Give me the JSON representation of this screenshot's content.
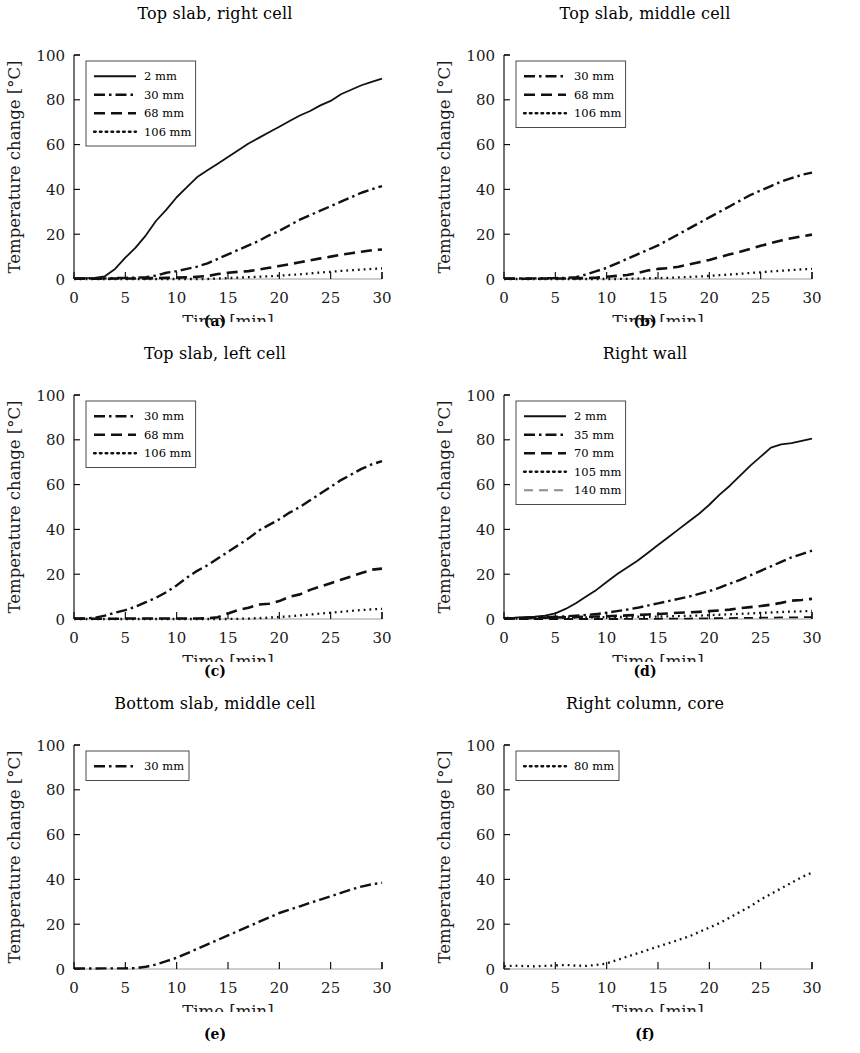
{
  "figure": {
    "ylabel": "Temperature change [°C]",
    "xlabel": "Time [min]",
    "y_ticks": [
      "0",
      "20",
      "40",
      "60",
      "80",
      "100"
    ],
    "x_ticks": [
      "0",
      "5",
      "10",
      "15",
      "20",
      "25",
      "30"
    ],
    "captions": [
      "(a)",
      "(b)",
      "(c)",
      "(d)",
      "(e)",
      "(f)"
    ]
  },
  "chart_data": [
    {
      "type": "line",
      "panel": "a",
      "caption": "(a)",
      "title": "Top slab, right cell",
      "xlabel": "Time [min]",
      "ylabel": "Temperature change [°C]",
      "xlim": [
        0,
        30
      ],
      "ylim": [
        0,
        100
      ],
      "xticks": [
        0,
        5,
        10,
        15,
        20,
        25,
        30
      ],
      "yticks": [
        0,
        20,
        40,
        60,
        80,
        100
      ],
      "grid": false,
      "legend_position": "upper-left",
      "x": [
        0,
        1,
        2,
        3,
        4,
        5,
        6,
        7,
        8,
        9,
        10,
        11,
        12,
        13,
        14,
        15,
        16,
        17,
        18,
        19,
        20,
        21,
        22,
        23,
        24,
        25,
        26,
        27,
        28,
        29,
        30
      ],
      "series": [
        {
          "name": "2 mm",
          "style": "solid",
          "values": [
            0.3,
            0.4,
            0.5,
            1.2,
            4.5,
            9.5,
            14.0,
            19.5,
            26.0,
            31.0,
            36.5,
            41.0,
            45.5,
            48.5,
            51.5,
            54.5,
            57.5,
            60.5,
            63.0,
            65.5,
            68.0,
            70.5,
            73.0,
            75.0,
            77.5,
            79.5,
            82.5,
            84.5,
            86.5,
            88.0,
            89.5
          ]
        },
        {
          "name": "30 mm",
          "style": "dashdot",
          "values": [
            0.2,
            0.2,
            0.3,
            0.3,
            0.4,
            0.5,
            0.6,
            0.8,
            1.5,
            2.8,
            3.5,
            4.5,
            5.5,
            7.0,
            9.0,
            11.0,
            13.0,
            15.0,
            17.0,
            19.5,
            21.5,
            24.0,
            26.5,
            28.5,
            30.5,
            32.5,
            34.5,
            36.5,
            38.5,
            40.0,
            41.5
          ]
        },
        {
          "name": "68 mm",
          "style": "dashed",
          "values": [
            0.1,
            0.1,
            0.1,
            0.1,
            0.2,
            0.2,
            0.2,
            0.3,
            0.4,
            0.5,
            0.6,
            0.8,
            1.0,
            1.3,
            2.2,
            2.8,
            3.2,
            3.5,
            4.2,
            5.0,
            5.8,
            6.6,
            7.5,
            8.3,
            9.2,
            10.0,
            10.8,
            11.5,
            12.2,
            12.8,
            13.2
          ]
        },
        {
          "name": "106 mm",
          "style": "dotted",
          "values": [
            0.0,
            0.0,
            0.0,
            0.0,
            0.0,
            0.0,
            0.0,
            0.0,
            0.0,
            0.0,
            0.0,
            0.0,
            0.0,
            0.0,
            0.2,
            0.4,
            0.6,
            0.8,
            1.0,
            1.2,
            1.5,
            1.8,
            2.1,
            2.5,
            2.9,
            3.2,
            3.6,
            3.9,
            4.2,
            4.5,
            4.7
          ]
        }
      ]
    },
    {
      "type": "line",
      "panel": "b",
      "caption": "(b)",
      "title": "Top slab, middle cell",
      "xlabel": "Time [min]",
      "ylabel": "Temperature change [°C]",
      "xlim": [
        0,
        30
      ],
      "ylim": [
        0,
        100
      ],
      "xticks": [
        0,
        5,
        10,
        15,
        20,
        25,
        30
      ],
      "yticks": [
        0,
        20,
        40,
        60,
        80,
        100
      ],
      "grid": false,
      "legend_position": "upper-left",
      "x": [
        0,
        1,
        2,
        3,
        4,
        5,
        6,
        7,
        8,
        9,
        10,
        11,
        12,
        13,
        14,
        15,
        16,
        17,
        18,
        19,
        20,
        21,
        22,
        23,
        24,
        25,
        26,
        27,
        28,
        29,
        30
      ],
      "series": [
        {
          "name": "30 mm",
          "style": "dashdot",
          "values": [
            0.2,
            0.2,
            0.3,
            0.3,
            0.4,
            0.4,
            0.5,
            0.8,
            2.0,
            3.5,
            5.0,
            7.0,
            9.0,
            11.0,
            13.0,
            15.0,
            17.5,
            20.0,
            22.5,
            25.0,
            27.5,
            30.0,
            32.5,
            35.0,
            37.5,
            39.5,
            41.5,
            43.5,
            45.0,
            46.5,
            47.5
          ]
        },
        {
          "name": "68 mm",
          "style": "dashed",
          "values": [
            0.1,
            0.1,
            0.1,
            0.1,
            0.2,
            0.2,
            0.2,
            0.3,
            0.4,
            0.6,
            1.0,
            1.4,
            1.8,
            2.6,
            3.8,
            4.5,
            4.8,
            5.5,
            6.5,
            7.5,
            8.5,
            9.8,
            11.0,
            12.2,
            13.5,
            14.8,
            16.0,
            17.2,
            18.2,
            19.0,
            19.8
          ]
        },
        {
          "name": "106 mm",
          "style": "dotted",
          "values": [
            0.0,
            0.0,
            0.0,
            0.0,
            0.0,
            0.0,
            0.0,
            0.0,
            0.0,
            0.0,
            0.0,
            0.0,
            0.1,
            0.2,
            0.3,
            0.4,
            0.5,
            0.7,
            0.9,
            1.1,
            1.4,
            1.7,
            2.0,
            2.3,
            2.7,
            3.0,
            3.4,
            3.7,
            4.0,
            4.3,
            4.5
          ]
        }
      ]
    },
    {
      "type": "line",
      "panel": "c",
      "caption": "(c)",
      "title": "Top slab, left cell",
      "xlabel": "Time [min]",
      "ylabel": "Temperature change [°C]",
      "xlim": [
        0,
        30
      ],
      "ylim": [
        0,
        100
      ],
      "xticks": [
        0,
        5,
        10,
        15,
        20,
        25,
        30
      ],
      "yticks": [
        0,
        20,
        40,
        60,
        80,
        100
      ],
      "grid": false,
      "legend_position": "upper-left",
      "x": [
        0,
        1,
        2,
        3,
        4,
        5,
        6,
        7,
        8,
        9,
        10,
        11,
        12,
        13,
        14,
        15,
        16,
        17,
        18,
        19,
        20,
        21,
        22,
        23,
        24,
        25,
        26,
        27,
        28,
        29,
        30
      ],
      "series": [
        {
          "name": "30 mm",
          "style": "dashdot",
          "values": [
            0.2,
            0.3,
            0.5,
            1.5,
            2.8,
            4.0,
            5.5,
            7.5,
            9.5,
            12.0,
            15.0,
            18.5,
            21.5,
            24.0,
            27.0,
            30.0,
            33.0,
            36.0,
            39.5,
            42.0,
            44.5,
            47.5,
            50.0,
            53.0,
            56.0,
            59.0,
            62.0,
            64.5,
            67.0,
            69.0,
            70.5
          ]
        },
        {
          "name": "68 mm",
          "style": "dashed",
          "values": [
            0.1,
            0.1,
            0.1,
            0.1,
            0.1,
            0.2,
            0.2,
            0.2,
            0.2,
            0.2,
            0.2,
            0.2,
            0.2,
            0.3,
            0.8,
            2.5,
            4.0,
            5.0,
            6.5,
            6.8,
            8.0,
            10.0,
            11.0,
            13.0,
            14.5,
            16.0,
            17.5,
            19.0,
            20.5,
            22.0,
            22.5
          ]
        },
        {
          "name": "106 mm",
          "style": "dotted",
          "values": [
            0.0,
            0.0,
            0.0,
            0.0,
            0.0,
            0.0,
            0.0,
            0.0,
            0.0,
            0.0,
            0.0,
            0.0,
            0.0,
            0.0,
            0.0,
            0.0,
            0.1,
            0.2,
            0.4,
            0.6,
            0.9,
            1.2,
            1.6,
            2.0,
            2.4,
            2.8,
            3.2,
            3.6,
            4.0,
            4.3,
            4.5
          ]
        }
      ]
    },
    {
      "type": "line",
      "panel": "d",
      "caption": "(d)",
      "title": "Right wall",
      "xlabel": "Time [min]",
      "ylabel": "Temperature change [°C]",
      "xlim": [
        0,
        30
      ],
      "ylim": [
        0,
        100
      ],
      "xticks": [
        0,
        5,
        10,
        15,
        20,
        25,
        30
      ],
      "yticks": [
        0,
        20,
        40,
        60,
        80,
        100
      ],
      "grid": false,
      "legend_position": "upper-left",
      "x": [
        0,
        1,
        2,
        3,
        4,
        5,
        6,
        7,
        8,
        9,
        10,
        11,
        12,
        13,
        14,
        15,
        16,
        17,
        18,
        19,
        20,
        21,
        22,
        23,
        24,
        25,
        26,
        27,
        28,
        29,
        30
      ],
      "series": [
        {
          "name": "2 mm",
          "style": "solid",
          "values": [
            0.5,
            0.6,
            0.8,
            1.0,
            1.5,
            2.5,
            4.5,
            7.0,
            10.0,
            13.0,
            16.5,
            20.0,
            23.0,
            26.0,
            29.5,
            33.0,
            36.5,
            40.0,
            43.5,
            47.0,
            51.0,
            55.5,
            59.5,
            64.0,
            68.5,
            72.5,
            76.5,
            78.0,
            78.5,
            79.5,
            80.5
          ]
        },
        {
          "name": "35 mm",
          "style": "dashdot",
          "values": [
            0.3,
            0.4,
            0.5,
            0.6,
            0.8,
            1.0,
            1.2,
            1.5,
            1.8,
            2.2,
            2.8,
            3.5,
            4.2,
            5.0,
            6.0,
            7.0,
            8.0,
            9.0,
            10.0,
            11.2,
            12.5,
            14.0,
            15.8,
            17.5,
            19.5,
            21.5,
            23.5,
            25.5,
            27.5,
            29.0,
            30.5
          ]
        },
        {
          "name": "70 mm",
          "style": "dashed",
          "values": [
            0.2,
            0.3,
            0.4,
            0.5,
            0.6,
            0.7,
            0.8,
            0.9,
            1.0,
            1.1,
            1.2,
            1.4,
            1.6,
            1.8,
            2.0,
            2.2,
            2.5,
            2.8,
            3.0,
            3.2,
            3.5,
            3.8,
            4.2,
            4.8,
            5.3,
            5.8,
            6.4,
            7.2,
            8.2,
            8.5,
            9.0
          ]
        },
        {
          "name": "105 mm",
          "style": "dotted",
          "values": [
            0.1,
            0.2,
            0.3,
            0.4,
            0.5,
            0.6,
            0.6,
            0.7,
            0.7,
            0.8,
            0.8,
            0.9,
            0.9,
            1.0,
            1.0,
            1.1,
            1.2,
            1.3,
            1.4,
            1.5,
            1.7,
            1.9,
            2.1,
            2.3,
            2.5,
            2.7,
            2.9,
            3.1,
            3.3,
            3.4,
            3.6
          ]
        },
        {
          "name": "140 mm",
          "style": "dashed-light",
          "values": [
            0.0,
            0.0,
            0.0,
            0.0,
            0.0,
            0.0,
            0.0,
            0.0,
            0.0,
            0.0,
            0.0,
            0.0,
            0.1,
            0.1,
            0.1,
            0.1,
            0.2,
            0.2,
            0.2,
            0.3,
            0.3,
            0.4,
            0.4,
            0.5,
            0.5,
            0.6,
            0.6,
            0.7,
            0.7,
            0.8,
            0.8
          ]
        }
      ]
    },
    {
      "type": "line",
      "panel": "e",
      "caption": "(e)",
      "title": "Bottom slab, middle cell",
      "xlabel": "Time [min]",
      "ylabel": "Temperature change [°C]",
      "xlim": [
        0,
        30
      ],
      "ylim": [
        0,
        100
      ],
      "xticks": [
        0,
        5,
        10,
        15,
        20,
        25,
        30
      ],
      "yticks": [
        0,
        20,
        40,
        60,
        80,
        100
      ],
      "grid": false,
      "legend_position": "upper-left",
      "x": [
        0,
        1,
        2,
        3,
        4,
        5,
        6,
        7,
        8,
        9,
        10,
        11,
        12,
        13,
        14,
        15,
        16,
        17,
        18,
        19,
        20,
        21,
        22,
        23,
        24,
        25,
        26,
        27,
        28,
        29,
        30
      ],
      "series": [
        {
          "name": "30 mm",
          "style": "dashdot",
          "values": [
            0.2,
            0.2,
            0.2,
            0.3,
            0.3,
            0.3,
            0.4,
            1.0,
            2.0,
            3.5,
            5.0,
            7.0,
            9.0,
            11.0,
            13.0,
            15.0,
            17.0,
            19.0,
            21.0,
            23.0,
            25.0,
            26.5,
            28.0,
            29.5,
            31.0,
            32.5,
            34.0,
            35.5,
            36.8,
            37.8,
            38.5
          ]
        }
      ]
    },
    {
      "type": "line",
      "panel": "f",
      "caption": "(f)",
      "title": "Right column, core",
      "xlabel": "Time [min]",
      "ylabel": "Temperature change [°C]",
      "xlim": [
        0,
        30
      ],
      "ylim": [
        0,
        100
      ],
      "xticks": [
        0,
        5,
        10,
        15,
        20,
        25,
        30
      ],
      "yticks": [
        0,
        20,
        40,
        60,
        80,
        100
      ],
      "grid": false,
      "legend_position": "upper-left",
      "x": [
        0,
        1,
        2,
        3,
        4,
        5,
        6,
        7,
        8,
        9,
        10,
        11,
        12,
        13,
        14,
        15,
        16,
        17,
        18,
        19,
        20,
        21,
        22,
        23,
        24,
        25,
        26,
        27,
        28,
        29,
        30
      ],
      "series": [
        {
          "name": "80 mm",
          "style": "dotted",
          "values": [
            1.2,
            1.5,
            1.3,
            1.2,
            1.4,
            1.6,
            1.8,
            1.5,
            1.4,
            1.8,
            2.5,
            4.0,
            5.5,
            7.0,
            8.5,
            10.0,
            11.5,
            13.0,
            14.5,
            16.5,
            18.5,
            20.5,
            23.0,
            25.5,
            28.0,
            31.0,
            33.5,
            36.0,
            38.5,
            41.0,
            43.0
          ]
        }
      ]
    }
  ]
}
